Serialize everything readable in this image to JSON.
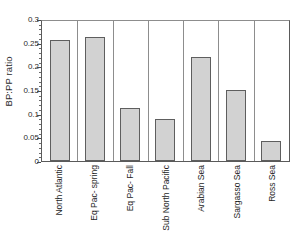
{
  "chart_data": {
    "type": "bar",
    "title": "",
    "xlabel": "",
    "ylabel": "BP:PP ratio",
    "ylim": [
      0,
      0.3
    ],
    "ytick_labels": [
      "0",
      "0.05",
      "0.1",
      "0.15",
      "0.2",
      "0.25",
      "0.3"
    ],
    "ytick_values": [
      0,
      0.05,
      0.1,
      0.15,
      0.2,
      0.25,
      0.3
    ],
    "minor_tick_interval": 0.01,
    "grid": false,
    "legend": null,
    "bar_fill_color": "#d2d2d2",
    "bar_edge_color": "#5e5e5e",
    "axis_color": "#5a5a5a",
    "categories": [
      "North Atlantic",
      "Eq Pac- spring",
      "Eq Pac- Fall",
      "Sub North Pacific",
      "Arabian Sea",
      "Sargasso Sea",
      "Ross Sea"
    ],
    "values": [
      0.255,
      0.263,
      0.113,
      0.088,
      0.219,
      0.15,
      0.042
    ]
  }
}
